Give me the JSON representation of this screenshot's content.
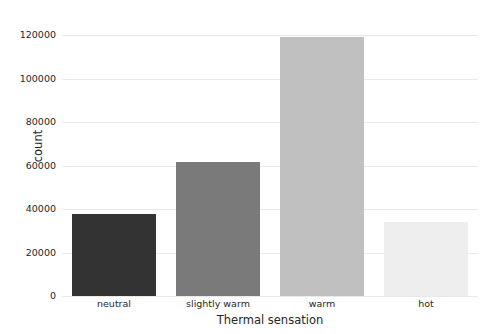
{
  "chart_data": {
    "type": "bar",
    "title": "",
    "xlabel": "Thermal sensation",
    "ylabel": "count",
    "categories": [
      "neutral",
      "slightly warm",
      "warm",
      "hot"
    ],
    "values": [
      37500,
      61500,
      119000,
      34000
    ],
    "series": [
      {
        "name": "count",
        "values": [
          37500,
          61500,
          119000,
          34000
        ]
      }
    ],
    "bar_colors": [
      "#333333",
      "#7a7a7a",
      "#c0c0c0",
      "#eeeeee"
    ],
    "ylim": [
      0,
      126000
    ],
    "yticks": [
      0,
      20000,
      40000,
      60000,
      80000,
      100000,
      120000
    ],
    "ytick_labels": [
      "0",
      "20000",
      "40000",
      "60000",
      "80000",
      "100000",
      "120000"
    ],
    "grid": true,
    "grid_axis": "y",
    "grid_color": "#e9e9e9",
    "legend": null,
    "background_color": "#ffffff",
    "text_color": "#262626"
  }
}
